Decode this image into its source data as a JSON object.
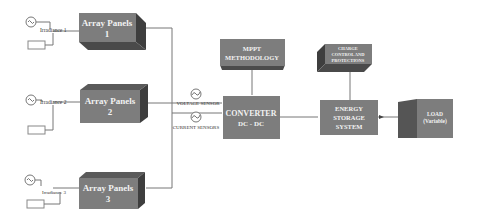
{
  "diagram": {
    "panels": [
      {
        "title": "Array Panels",
        "num": "1",
        "irradiance": "Irradiance 1"
      },
      {
        "title": "Array Panels",
        "num": "2",
        "irradiance": "Irradiance 2"
      },
      {
        "title": "Array Panels",
        "num": "3",
        "irradiance": "Irradiance 3"
      }
    ],
    "sensors": {
      "voltage": "VOLTAGE SENSOR",
      "current": "CURRENT SENSORS"
    },
    "mppt": {
      "line1": "MPPT",
      "line2": "METHODOLOGY"
    },
    "converter": {
      "line1": "CONVERTER",
      "line2": "DC - DC"
    },
    "charge": {
      "line1": "CHARGE",
      "line2": "CONTROL AND",
      "line3": "PROTECTIONS"
    },
    "storage": {
      "line1": "ENERGY",
      "line2": "STORAGE",
      "line3": "SYSTEM"
    },
    "load": {
      "line1": "LOAD",
      "line2": "(Variable)"
    },
    "colors": {
      "box_front": "#7a7a7a",
      "box_top": "#5a5a5a",
      "box_side": "#3e3e3e",
      "line": "#666666"
    }
  }
}
